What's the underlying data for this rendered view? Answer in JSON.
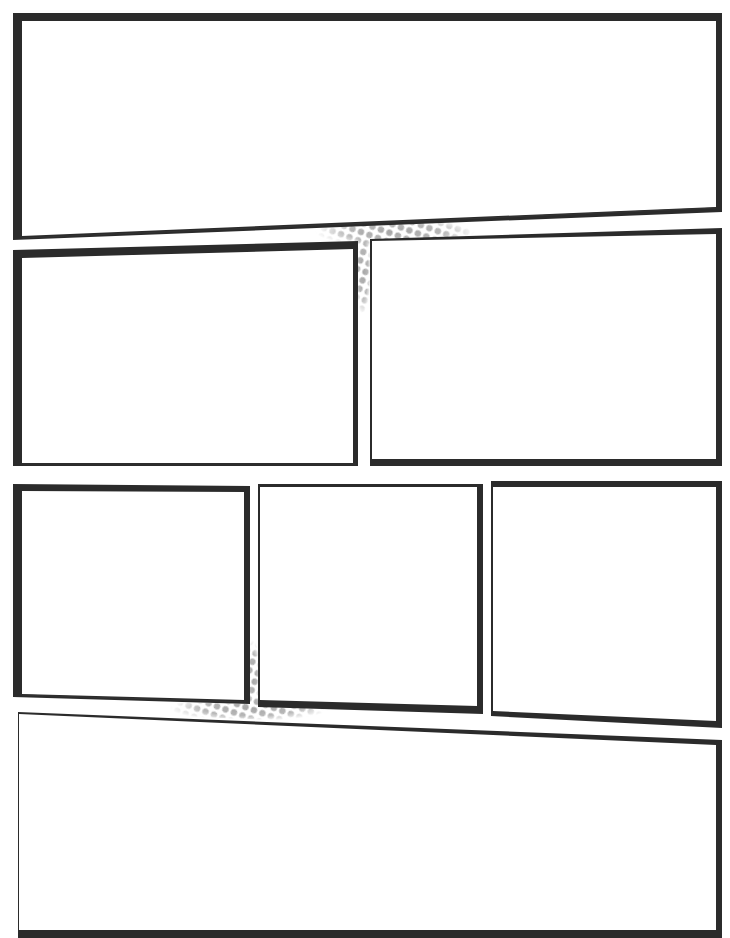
{
  "page": {
    "type": "comic-panel-template",
    "title_fragment": "",
    "ink_color": "#2b2b2b",
    "halftone_color": "#a8a8a8",
    "background": "#ffffff"
  },
  "rows": [
    {
      "row": 1,
      "panels": [
        "panel-1"
      ]
    },
    {
      "row": 2,
      "panels": [
        "panel-2",
        "panel-3"
      ]
    },
    {
      "row": 3,
      "panels": [
        "panel-4",
        "panel-5",
        "panel-6"
      ]
    },
    {
      "row": 4,
      "panels": [
        "panel-7"
      ]
    }
  ],
  "panels": [
    {
      "id": "panel-1",
      "label": "Panel 1"
    },
    {
      "id": "panel-2",
      "label": "Panel 2"
    },
    {
      "id": "panel-3",
      "label": "Panel 3"
    },
    {
      "id": "panel-4",
      "label": "Panel 4"
    },
    {
      "id": "panel-5",
      "label": "Panel 5"
    },
    {
      "id": "panel-6",
      "label": "Panel 6"
    },
    {
      "id": "panel-7",
      "label": "Panel 7"
    }
  ],
  "decorations": [
    {
      "id": "halftone-upper",
      "position": "gutter between panels 1, 2, 3"
    },
    {
      "id": "halftone-lower",
      "position": "gutter between panels 4, 5, 7"
    }
  ]
}
